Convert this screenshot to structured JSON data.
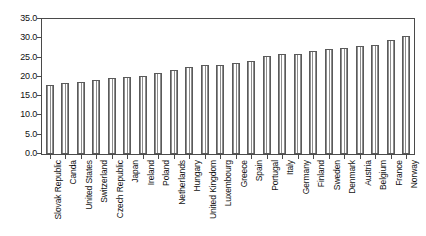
{
  "chart_data": {
    "type": "bar",
    "title": "",
    "subtitle": "",
    "xlabel": "",
    "ylabel": "",
    "ylim": [
      0.0,
      35.0
    ],
    "ytick_step": 5.0,
    "ytick_labels": [
      "35.0",
      "30.0",
      "25.0",
      "20.0",
      "15.0",
      "10.0",
      "5.0",
      "0.0"
    ],
    "ytick_values": [
      35.0,
      30.0,
      25.0,
      20.0,
      15.0,
      10.0,
      5.0,
      0.0
    ],
    "grid": false,
    "legend": false,
    "legend_position": "none",
    "bar_fill": "vertical-line-hatch",
    "bar_edge_color": "#5a5a5a",
    "bar_face_color": "#ffffff",
    "hatch_color": "#8d8d8d",
    "axis_color": "#4a4a4a",
    "categories": [
      "Slovak Republic",
      "Canda",
      "United States",
      "Switzerland",
      "Czech Republic",
      "Japan",
      "Ireland",
      "Poland",
      "Netherlands",
      "Hungary",
      "United Kingdom",
      "Luxembourg",
      "Greece",
      "Spain",
      "Portugal",
      "Italy",
      "Germany",
      "Finland",
      "Sweden",
      "Denmark",
      "Austria",
      "Belgium",
      "France",
      "Norway"
    ],
    "values": [
      17.8,
      18.3,
      18.6,
      19.2,
      19.8,
      20.0,
      20.3,
      21.1,
      21.7,
      22.5,
      23.0,
      23.1,
      23.6,
      24.2,
      25.4,
      26.0,
      26.0,
      26.8,
      27.3,
      27.6,
      27.9,
      28.2,
      29.5,
      30.5
    ]
  }
}
